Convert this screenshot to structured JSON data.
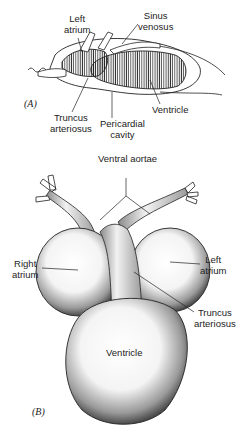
{
  "panel_a": {
    "tag": "(A)",
    "labels": {
      "left_atrium_1": "Left",
      "left_atrium_2": "atrium",
      "sinus_venosus_1": "Sinus",
      "sinus_venosus_2": "venosus",
      "truncus_1": "Truncus",
      "truncus_2": "arteriosus",
      "pericardial_1": "Pericardial",
      "pericardial_2": "cavity",
      "ventricle": "Ventricle"
    }
  },
  "panel_b": {
    "tag": "(B)",
    "labels": {
      "ventral_aortae": "Ventral aortae",
      "right_atrium_1": "Right",
      "right_atrium_2": "atrium",
      "left_atrium_1": "Left",
      "left_atrium_2": "atrium",
      "truncus_1": "Truncus",
      "truncus_2": "arteriosus",
      "ventricle": "Ventricle"
    }
  }
}
